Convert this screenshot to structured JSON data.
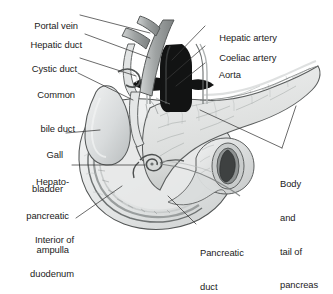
{
  "figure": {
    "caption_partial": "",
    "background_color": "#ffffff",
    "ink_color": "#1b1b1b",
    "leader_color": "#3a3a3a",
    "palette": {
      "duodenum_wall": "#cfd2d2",
      "duodenum_lumen": "#e9ebeb",
      "pancreas": "#dfe1e0",
      "gallbladder": "#d6d9da",
      "vessel_grey": "#a9adad",
      "aorta_dark": "#131313",
      "outline": "#4a4d4d"
    }
  },
  "labels": [
    {
      "id": "portal-vein",
      "text": "Portal vein",
      "side": "left",
      "lines": [
        "Portal vein"
      ]
    },
    {
      "id": "hepatic-duct",
      "text": "Hepatic duct",
      "side": "left",
      "lines": [
        "Hepatic duct"
      ]
    },
    {
      "id": "cystic-duct",
      "text": "Cystic duct",
      "side": "left",
      "lines": [
        "Cystic duct"
      ]
    },
    {
      "id": "common-bile-duct",
      "text": "Common bile duct",
      "side": "left",
      "lines": [
        "Common",
        "bile duct"
      ]
    },
    {
      "id": "gall-bladder",
      "text": "Gall bladder",
      "side": "left",
      "lines": [
        "Gall",
        "bladder"
      ]
    },
    {
      "id": "hepatopancreatic-ampulla",
      "text": "Hepato-pancreatic ampulla",
      "side": "left",
      "lines": [
        "Hepato-",
        "pancreatic",
        "ampulla"
      ]
    },
    {
      "id": "interior-of-duodenum",
      "text": "Interior of duodenum",
      "side": "left",
      "lines": [
        "Interior of",
        "duodenum"
      ]
    },
    {
      "id": "hepatic-artery",
      "text": "Hepatic artery",
      "side": "right",
      "lines": [
        "Hepatic artery"
      ]
    },
    {
      "id": "coeliac-artery",
      "text": "Coeliac artery",
      "side": "right",
      "lines": [
        "Coeliac artery"
      ]
    },
    {
      "id": "aorta",
      "text": "Aorta",
      "side": "right",
      "lines": [
        "Aorta"
      ]
    },
    {
      "id": "body-and-tail-of-pancreas",
      "text": "Body and tail of pancreas",
      "side": "right",
      "lines": [
        "Body",
        "and",
        "tail of",
        "pancreas"
      ]
    },
    {
      "id": "pancreatic-duct",
      "text": "Pancreatic duct",
      "side": "right",
      "lines": [
        "Pancreatic",
        "duct"
      ]
    }
  ],
  "label_text": {
    "portal_vein": "Portal vein",
    "hepatic_duct": "Hepatic duct",
    "cystic_duct": "Cystic duct",
    "common_1": "Common",
    "common_2": "bile duct",
    "gall_1": "Gall",
    "gall_2": "bladder",
    "hpa_1": "Hepato-",
    "hpa_2": "pancreatic",
    "hpa_3": "ampulla",
    "interior_1": "Interior of",
    "interior_2": "duodenum",
    "hepatic_artery": "Hepatic artery",
    "coeliac_artery": "Coeliac artery",
    "aorta": "Aorta",
    "body_1": "Body",
    "body_2": "and",
    "body_3": "tail of",
    "body_4": "pancreas",
    "pancreatic_1": "Pancreatic",
    "pancreatic_2": "duct"
  }
}
